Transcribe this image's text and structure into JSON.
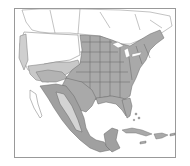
{
  "map": {
    "type": "range-distribution",
    "region": "North America",
    "colors": {
      "background": "#ffffff",
      "frame": "#888888",
      "land_outside": "#ffffff",
      "boundary": "#777777",
      "range_primary": "#a8a8a8",
      "range_secondary": "#cfcfcf",
      "water_caribbean": "#ffffff"
    },
    "legend": [],
    "labels": []
  }
}
